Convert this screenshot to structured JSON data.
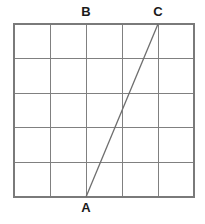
{
  "figure": {
    "kind": "geometry-grid-diagram",
    "canvas": {
      "width": 205,
      "height": 224,
      "background": "#ffffff"
    },
    "grid": {
      "name": "square-lattice",
      "columns": 5,
      "rows": 5,
      "left": 14,
      "top": 24,
      "right": 194,
      "bottom": 197,
      "cell_width": 36,
      "cell_height": 34.6,
      "line_color": "#808080",
      "line_width": 1,
      "border_color": "#7a7a7a",
      "border_width": 1.2,
      "x_lines": [
        14,
        50,
        86,
        122,
        158,
        194
      ],
      "y_lines": [
        24,
        58.6,
        93.2,
        127.8,
        162.4,
        197
      ]
    },
    "segments": [
      {
        "name": "segment-AC",
        "from": "A",
        "to": "C",
        "x1": 86,
        "y1": 197,
        "x2": 158,
        "y2": 24,
        "color": "#6e6e6e",
        "width": 1.3
      }
    ],
    "points": [
      {
        "id": "A",
        "label": "A",
        "x": 86,
        "y": 197,
        "grid_col": 2,
        "grid_row": 5,
        "label_position": "below"
      },
      {
        "id": "B",
        "label": "B",
        "x": 86,
        "y": 24,
        "grid_col": 2,
        "grid_row": 0,
        "label_position": "above"
      },
      {
        "id": "C",
        "label": "C",
        "x": 158,
        "y": 24,
        "grid_col": 4,
        "grid_row": 0,
        "label_position": "above"
      }
    ]
  }
}
